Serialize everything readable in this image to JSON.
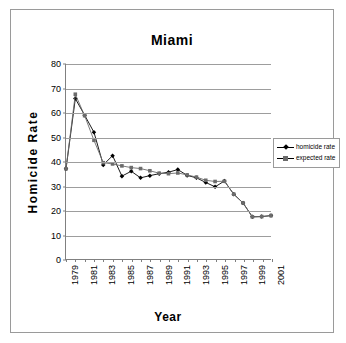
{
  "figure": {
    "title": "Miami",
    "xlabel": "Year",
    "ylabel": "Homicide Rate"
  },
  "legend": {
    "position": "right",
    "items": [
      {
        "label": "homicide rate",
        "marker": "diamond",
        "color": "#000000"
      },
      {
        "label": "expected rate",
        "marker": "square",
        "color": "#6b6b6b"
      }
    ]
  },
  "axes": {
    "y_ticks": [
      80,
      70,
      60,
      50,
      40,
      30,
      20,
      10,
      0
    ],
    "x_ticks": [
      "1979",
      "1981",
      "1983",
      "1985",
      "1987",
      "1989",
      "1991",
      "1993",
      "1995",
      "1997",
      "1999",
      "2001"
    ]
  },
  "chart_data": {
    "type": "line",
    "title": "Miami",
    "xlabel": "Year",
    "ylabel": "Homicide Rate",
    "grid": true,
    "legend_position": "right",
    "ylim": [
      0,
      80
    ],
    "yticks": [
      0,
      10,
      20,
      30,
      40,
      50,
      60,
      70,
      80
    ],
    "x": [
      1979,
      1980,
      1981,
      1982,
      1983,
      1984,
      1985,
      1986,
      1987,
      1988,
      1989,
      1990,
      1991,
      1992,
      1993,
      1994,
      1995,
      1996,
      1997,
      1998,
      1999,
      2000,
      2001
    ],
    "xtick_labels": [
      "1979",
      "1981",
      "1983",
      "1985",
      "1987",
      "1989",
      "1991",
      "1993",
      "1995",
      "1997",
      "1999",
      "2001"
    ],
    "series": [
      {
        "name": "homicide rate",
        "color": "#000000",
        "marker": "diamond",
        "values": [
          37.0,
          65.8,
          59.0,
          52.0,
          38.6,
          42.4,
          34.0,
          36.0,
          33.3,
          34.2,
          35.0,
          35.6,
          36.7,
          34.3,
          33.3,
          31.4,
          29.6,
          32.0,
          26.6,
          23.0,
          17.3,
          17.4,
          17.8
        ]
      },
      {
        "name": "expected rate",
        "color": "#6b6b6b",
        "marker": "square",
        "values": [
          37.0,
          67.6,
          58.8,
          48.7,
          39.5,
          39.0,
          38.2,
          37.5,
          37.1,
          36.2,
          35.2,
          35.0,
          35.3,
          34.5,
          33.6,
          32.3,
          31.8,
          31.9,
          26.6,
          23.0,
          17.3,
          17.4,
          17.8
        ]
      }
    ]
  }
}
